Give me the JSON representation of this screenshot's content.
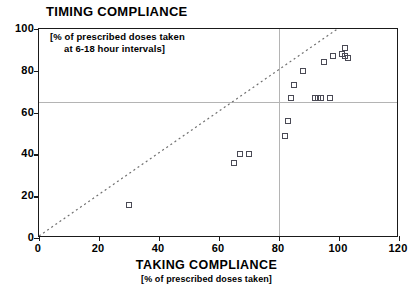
{
  "chart_data": {
    "type": "scatter",
    "title": "TIMING COMPLIANCE",
    "y_annotation_line1": "[% of prescribed doses taken",
    "y_annotation_line2": "at 6-18 hour intervals]",
    "xlabel": "TAKING COMPLIANCE",
    "x_sublabel": "[% of prescribed doses taken]",
    "ylabel": "",
    "xlim": [
      0,
      120
    ],
    "ylim": [
      0,
      100
    ],
    "xticks": [
      0,
      20,
      40,
      60,
      80,
      100,
      120
    ],
    "yticks": [
      0,
      20,
      40,
      60,
      80,
      100
    ],
    "grid": false,
    "reference_lines": [
      {
        "name": "horizontal-threshold",
        "orientation": "horizontal",
        "value": 65,
        "color": "#b4b4b4"
      },
      {
        "name": "vertical-threshold",
        "orientation": "vertical",
        "value": 80,
        "color": "#b4b4b4"
      }
    ],
    "identity_line": {
      "name": "identity-line",
      "style": "dotted",
      "from": [
        0,
        0
      ],
      "to": [
        100,
        100
      ],
      "color": "#707070"
    },
    "marker": {
      "shape": "open-square",
      "edge_color": "#4a4a55",
      "fill": "none",
      "size": 6
    },
    "points": [
      {
        "x": 30,
        "y": 16
      },
      {
        "x": 65,
        "y": 36
      },
      {
        "x": 67,
        "y": 40
      },
      {
        "x": 70,
        "y": 40
      },
      {
        "x": 82,
        "y": 49
      },
      {
        "x": 83,
        "y": 56
      },
      {
        "x": 84,
        "y": 67
      },
      {
        "x": 85,
        "y": 73
      },
      {
        "x": 88,
        "y": 80
      },
      {
        "x": 92,
        "y": 67
      },
      {
        "x": 93,
        "y": 67
      },
      {
        "x": 94,
        "y": 67
      },
      {
        "x": 95,
        "y": 84
      },
      {
        "x": 97,
        "y": 67
      },
      {
        "x": 98,
        "y": 87
      },
      {
        "x": 101,
        "y": 88
      },
      {
        "x": 102,
        "y": 87
      },
      {
        "x": 102,
        "y": 91
      },
      {
        "x": 103,
        "y": 86
      }
    ]
  }
}
